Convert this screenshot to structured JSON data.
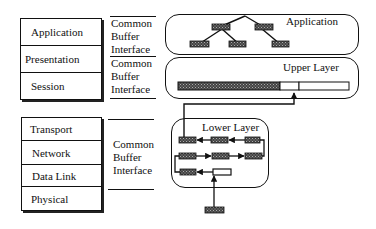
{
  "osi_upper_stack": {
    "layers": [
      "Application",
      "Presentation",
      "Session"
    ]
  },
  "osi_lower_stack": {
    "layers": [
      "Transport",
      "Network",
      "Data Link",
      "Physical"
    ]
  },
  "interfaces": [
    {
      "line1": "Common",
      "line2": "Buffer",
      "line3": "Interface"
    },
    {
      "line1": "Common",
      "line2": "Buffer",
      "line3": "Interface"
    },
    {
      "line1": "Common",
      "line2": "Buffer",
      "line3": "Interface"
    }
  ],
  "right_boxes": {
    "application": {
      "label": "Application"
    },
    "upper_layer": {
      "label": "Upper Layer"
    },
    "lower_layer": {
      "label": "Lower Layer"
    }
  },
  "colors": {
    "stroke": "#111111",
    "buffer_fill": "#555555",
    "background": "#ffffff"
  }
}
